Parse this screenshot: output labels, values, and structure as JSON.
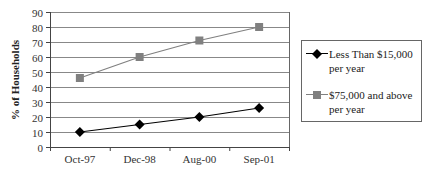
{
  "chart_data": {
    "type": "line",
    "title": "",
    "xlabel": "",
    "ylabel": "% of Households",
    "categories": [
      "Oct-97",
      "Dec-98",
      "Aug-00",
      "Sep-01"
    ],
    "series": [
      {
        "name": "Less Than $15,000 per year",
        "values": [
          10,
          15,
          20,
          26
        ],
        "color": "#000000",
        "marker": "diamond"
      },
      {
        "name": "$75,000 and above per year",
        "values": [
          46,
          60,
          71,
          80
        ],
        "color": "#808080",
        "marker": "square"
      }
    ],
    "ylim": [
      0,
      90
    ],
    "yticks": [
      0,
      10,
      20,
      30,
      40,
      50,
      60,
      70,
      80,
      90
    ],
    "grid": true,
    "legend_position": "right"
  },
  "legend": {
    "items": [
      {
        "line1": "Less Than $15,000",
        "line2": "per year"
      },
      {
        "line1": "$75,000 and above",
        "line2": "per year"
      }
    ]
  },
  "axis": {
    "ylabel": "% of Households"
  }
}
